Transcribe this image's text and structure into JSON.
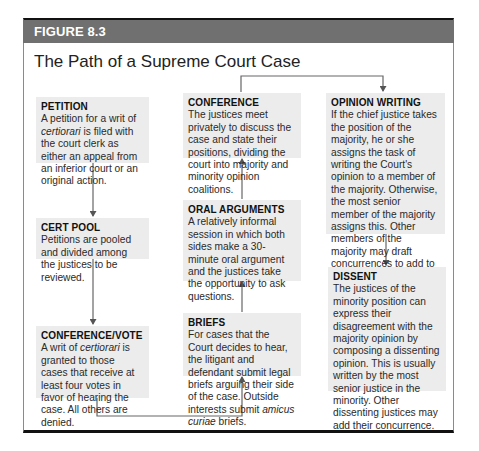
{
  "figure": {
    "label": "FIGURE 8.3",
    "title": "The Path of a Supreme Court Case",
    "colors": {
      "header_bar": "#707070",
      "box_fill": "#ececec",
      "arrow": "#555555",
      "frame_line": "#111111"
    }
  },
  "nodes": [
    {
      "id": "petition",
      "heading": "PETITION",
      "text_parts": [
        "A petition for a writ of ",
        "certiorari",
        " is filed with the court clerk as either an appeal from an inferior court or an original action."
      ]
    },
    {
      "id": "cert_pool",
      "heading": "CERT POOL",
      "text_parts": [
        "Petitions are pooled and divided among the justices to be reviewed."
      ]
    },
    {
      "id": "conference_vote",
      "heading": "CONFERENCE/VOTE",
      "text_parts": [
        "A writ of ",
        "certiorari",
        " is granted to those cases that receive at least four votes in favor of hearing the case. All others are denied."
      ]
    },
    {
      "id": "briefs",
      "heading": "BRIEFS",
      "text_parts": [
        "For cases that the Court decides to hear, the litigant and defendant submit legal briefs arguing their side of the case. Outside interests submit ",
        "amicus curiae",
        " briefs."
      ]
    },
    {
      "id": "oral_arguments",
      "heading": "ORAL ARGUMENTS",
      "text_parts": [
        "A relatively informal session in which both sides make a 30-minute oral argument and the justices take the opportunity to ask questions."
      ]
    },
    {
      "id": "conference",
      "heading": "CONFERENCE",
      "text_parts": [
        "The justices meet privately to discuss the case and state their positions, dividing the court into majority and minority opinion coalitions."
      ]
    },
    {
      "id": "opinion_writing",
      "heading": "OPINION WRITING",
      "text_parts": [
        "If the chief justice takes the position of the majority, he or she assigns the task of writing the Court's opinion to a member of the majority. Otherwise, the most senior member of the majority assigns this. Other members of the majority may draft concurrences to add to the opinion of the Court."
      ]
    },
    {
      "id": "dissent",
      "heading": "DISSENT",
      "text_parts": [
        "The justices of the minority position can express their disagreement with the majority opinion by composing a dissenting opinion. This is usually written by the most senior justice in the minority. Other dissenting justices may add their concurrence."
      ]
    }
  ],
  "edges": [
    {
      "from": "petition",
      "to": "cert_pool"
    },
    {
      "from": "cert_pool",
      "to": "conference_vote"
    },
    {
      "from": "conference_vote",
      "to": "briefs"
    },
    {
      "from": "briefs",
      "to": "oral_arguments"
    },
    {
      "from": "oral_arguments",
      "to": "conference"
    },
    {
      "from": "conference",
      "to": "opinion_writing"
    },
    {
      "from": "opinion_writing",
      "to": "dissent"
    }
  ]
}
